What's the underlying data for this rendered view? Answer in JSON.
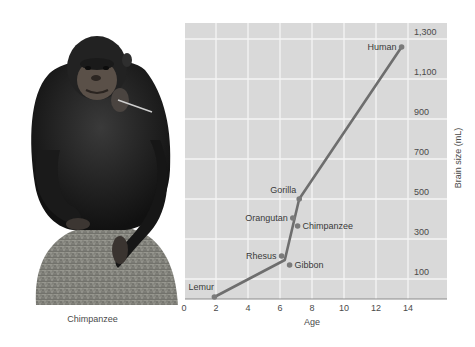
{
  "photo": {
    "subject": "chimpanzee-seated-on-rock",
    "caption": "Chimpanzee"
  },
  "chart_data": {
    "type": "line",
    "title": "",
    "xlabel": "Age",
    "ylabel": "Brain size (mL)",
    "xlim": [
      0,
      16
    ],
    "ylim": [
      0,
      1400
    ],
    "x_ticks": [
      "0",
      "2",
      "4",
      "6",
      "8",
      "10",
      "12",
      "14"
    ],
    "y_ticks": [
      "100",
      "300",
      "500",
      "700",
      "900",
      "1,100",
      "1,300"
    ],
    "grid": true,
    "colors": {
      "plot_bg": "#d9d9d9",
      "grid": "#f4f4f4",
      "line": "#6e6e6e",
      "marker": "#7a7a7a",
      "axis": "#8c8c8c"
    },
    "line_series": {
      "name": "Trend",
      "points": [
        {
          "x": 1.9,
          "y": 10
        },
        {
          "x": 6.3,
          "y": 195
        },
        {
          "x": 7.2,
          "y": 500
        },
        {
          "x": 13.6,
          "y": 1260
        }
      ]
    },
    "points": [
      {
        "label": "Lemur",
        "x": 1.9,
        "y": 10,
        "label_pos": "above-left"
      },
      {
        "label": "Rhesus",
        "x": 6.1,
        "y": 215,
        "label_pos": "left"
      },
      {
        "label": "Gibbon",
        "x": 6.6,
        "y": 170,
        "label_pos": "right"
      },
      {
        "label": "Orangutan",
        "x": 6.8,
        "y": 405,
        "label_pos": "left"
      },
      {
        "label": "Chimpanzee",
        "x": 7.1,
        "y": 365,
        "label_pos": "right"
      },
      {
        "label": "Gorilla",
        "x": 7.2,
        "y": 500,
        "label_pos": "above-left"
      },
      {
        "label": "Human",
        "x": 13.6,
        "y": 1260,
        "label_pos": "left"
      }
    ]
  }
}
